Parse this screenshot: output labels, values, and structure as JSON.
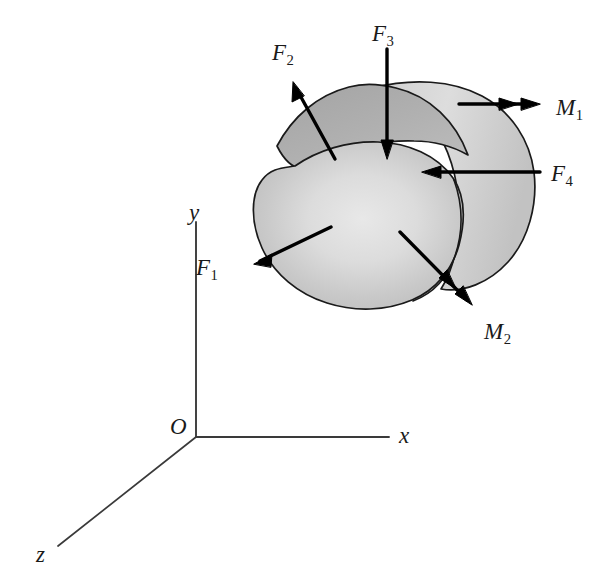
{
  "figure": {
    "kind": "free-body-diagram",
    "colors": {
      "outline": "#1a1a1a",
      "arrow": "#000000",
      "axis": "#3a3a3a",
      "body_front_face": "#c9c9c9",
      "body_front_highlight": "#e4e4e4",
      "body_back_surface": "#a8a8a8",
      "background": "#ffffff"
    }
  },
  "axes": {
    "origin": {
      "label": "O",
      "x": 186,
      "y": 427
    },
    "items": [
      {
        "name": "y-axis",
        "label": "y",
        "label_x": 189,
        "label_y": 201
      },
      {
        "name": "x-axis",
        "label": "x",
        "label_x": 399,
        "label_y": 424
      },
      {
        "name": "z-axis",
        "label": "z",
        "label_x": 36,
        "label_y": 543
      }
    ]
  },
  "vectors": [
    {
      "name": "force-f1",
      "label": "F",
      "subscript": "1",
      "type": "force",
      "arrowheads": 1,
      "label_x": 196,
      "label_y": 256,
      "tail": {
        "x": 331,
        "y": 227
      },
      "tip": {
        "x": 254,
        "y": 264
      }
    },
    {
      "name": "force-f2",
      "label": "F",
      "subscript": "2",
      "type": "force",
      "arrowheads": 1,
      "label_x": 272,
      "label_y": 41,
      "tail": {
        "x": 335,
        "y": 159
      },
      "tip": {
        "x": 293,
        "y": 82
      }
    },
    {
      "name": "force-f3",
      "label": "F",
      "subscript": "3",
      "type": "force",
      "arrowheads": 1,
      "label_x": 372,
      "label_y": 22,
      "tail": {
        "x": 387,
        "y": 49
      },
      "tip": {
        "x": 387,
        "y": 159
      }
    },
    {
      "name": "force-f4",
      "label": "F",
      "subscript": "4",
      "type": "force",
      "arrowheads": 1,
      "label_x": 551,
      "label_y": 162,
      "tail": {
        "x": 540,
        "y": 172
      },
      "tip": {
        "x": 422,
        "y": 172
      }
    },
    {
      "name": "moment-m1",
      "label": "M",
      "subscript": "1",
      "type": "moment",
      "arrowheads": 2,
      "label_x": 556,
      "label_y": 96,
      "tail": {
        "x": 459,
        "y": 104
      },
      "tip": {
        "x": 540,
        "y": 104
      }
    },
    {
      "name": "moment-m2",
      "label": "M",
      "subscript": "2",
      "type": "moment",
      "arrowheads": 2,
      "label_x": 484,
      "label_y": 320,
      "tail": {
        "x": 400,
        "y": 232
      },
      "tip": {
        "x": 472,
        "y": 305
      }
    }
  ]
}
